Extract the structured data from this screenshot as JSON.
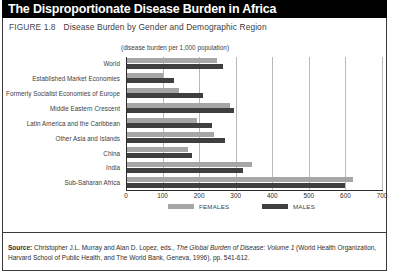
{
  "header": {
    "title": "The Disproportionate Disease Burden in Africa"
  },
  "caption": {
    "label": "FIGURE 1.8",
    "title": "Disease Burden by Gender and Demographic Region"
  },
  "source": {
    "label": "Source:",
    "text_before_italic": " Christopher J.L. Murray and Alan D. Lopez, eds., ",
    "italic_title": "The Global Burden of Disease: Volume 1",
    "text_after_italic": " (World Health Organization, Harvard School of Public Health, and The World Bank, Geneva, 1996), pp. 541-612."
  },
  "colors": {
    "female": "#a6a6a6",
    "male": "#3f3f3f",
    "header_bg": "#000000",
    "header_text": "#ffffff",
    "gridline": "#b9b9b9",
    "axis": "#2d2d2d"
  },
  "chart_data": {
    "type": "bar",
    "orientation": "horizontal",
    "title": "Disease Burden by Gender and Demographic Region",
    "subtitle": "(disease burden per 1,000 population)",
    "xlabel": "",
    "ylabel": "",
    "xlim": [
      0,
      700
    ],
    "xticks": [
      0,
      100,
      200,
      300,
      400,
      500,
      600,
      700
    ],
    "xtick_labels": [
      "0",
      "100",
      "200",
      "300",
      "400",
      "500",
      "600",
      "700"
    ],
    "grid": true,
    "grid_axis": "x",
    "legend_position": "bottom",
    "categories": [
      "World",
      "Established Market Economies",
      "Formerly Socialist Economies of Europe",
      "Middle Eastern Crescent",
      "Latin America and the Caribbean",
      "Other Asia and Islands",
      "China",
      "India",
      "Sub-Saharan Africa"
    ],
    "series": [
      {
        "name": "FEMALES",
        "color": "#a6a6a6",
        "values": [
          250,
          100,
          145,
          285,
          195,
          240,
          170,
          345,
          620
        ]
      },
      {
        "name": "MALES",
        "color": "#3f3f3f",
        "values": [
          265,
          130,
          210,
          295,
          235,
          270,
          180,
          320,
          600
        ]
      }
    ]
  }
}
